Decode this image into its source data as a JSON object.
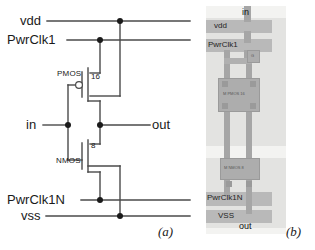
{
  "figure": {
    "caption_a": "(a)",
    "caption_b": "(b)"
  },
  "schematic": {
    "rails": {
      "vdd": "vdd",
      "pwrclk1": "PwrClk1",
      "pwrclk1n": "PwrClk1N",
      "vss": "vss"
    },
    "ports": {
      "input": "in",
      "output": "out"
    },
    "devices": [
      {
        "name": "PMOS",
        "label": "PMOS",
        "width": "16"
      },
      {
        "name": "NMOS",
        "label": "NMOS",
        "width": "8"
      }
    ],
    "colors": {
      "wire": "#4a4a4a",
      "text": "#1a1a1a",
      "junction": "#1a1a1a"
    }
  },
  "layout": {
    "ports": {
      "input": "in",
      "output": "out"
    },
    "rails": {
      "vdd": "vdd",
      "pwrclk1": "PwrClk1",
      "pwrclk1n": "PwrClk1N",
      "vss": "VSS"
    },
    "devices": [
      {
        "name": "pmos-cell",
        "label": "M PMOS 16"
      },
      {
        "name": "nmos-cell",
        "label": "M NMOS 8"
      }
    ],
    "pins": {
      "gate_tap": "G",
      "d1": "D",
      "d2": "D",
      "s1": "S",
      "s2": "S"
    },
    "colors": {
      "background": "#f3f3f1",
      "metal": "#b9b9b9",
      "well": "#e3e3e1",
      "poly": "#b0b0b0",
      "device": "#adadad"
    }
  }
}
